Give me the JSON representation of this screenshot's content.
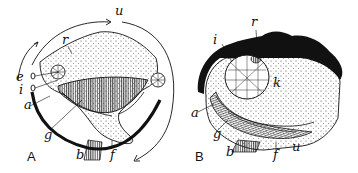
{
  "figure": {
    "panels": [
      {
        "id": "A",
        "label": "A",
        "part_labels": {
          "u": "u",
          "r": "r",
          "e": "e",
          "i": "i",
          "a": "a",
          "g": "g",
          "b": "b",
          "f": "f"
        }
      },
      {
        "id": "B",
        "label": "B",
        "part_labels": {
          "i": "i",
          "r": "r",
          "e": "e",
          "k": "k",
          "a": "a",
          "g": "g",
          "b": "b",
          "f": "f",
          "u": "u"
        }
      }
    ],
    "colors": {
      "ink": "#111111",
      "background": "#ffffff",
      "stipple": "#333333"
    }
  }
}
